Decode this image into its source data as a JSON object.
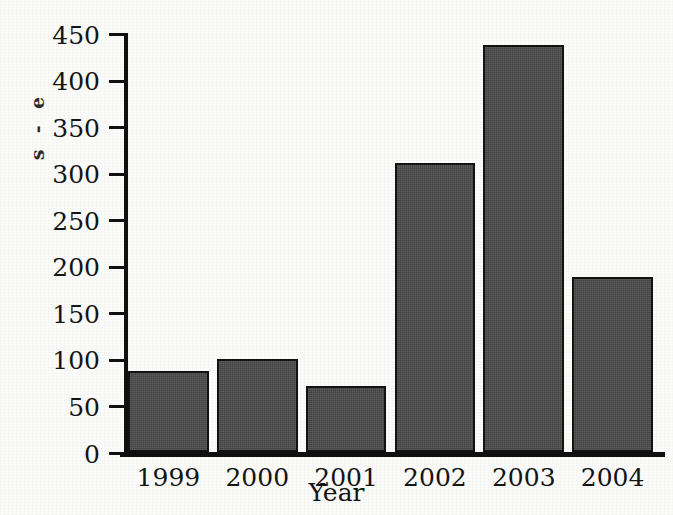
{
  "figure": {
    "clipped_caption_fragment": "s  -  e",
    "background_color": "#fbfbfa",
    "bar_fill_color": "#4a4a4a",
    "bar_outline_color": "#121212",
    "axis_color": "#101010"
  },
  "chart_data": {
    "type": "bar",
    "title": "",
    "xlabel": "Year",
    "ylabel": "Number of measles cases",
    "categories": [
      "1999",
      "2000",
      "2001",
      "2002",
      "2003",
      "2004"
    ],
    "values": [
      87,
      100,
      71,
      310,
      437,
      188
    ],
    "ylim": [
      0,
      450
    ],
    "ytick_values": [
      0,
      50,
      100,
      150,
      200,
      250,
      300,
      350,
      400,
      450
    ],
    "ytick_labels": [
      "0",
      "50",
      "100",
      "150",
      "200",
      "250",
      "300",
      "350",
      "400",
      "450"
    ],
    "grid": false,
    "legend": false,
    "legend_position": "none"
  }
}
